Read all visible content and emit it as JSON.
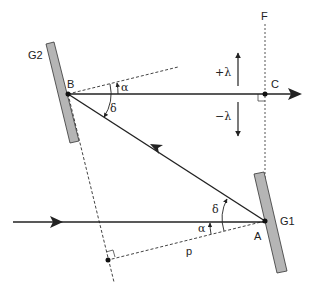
{
  "diagram": {
    "labels": {
      "g2": "G2",
      "g1": "G1",
      "b": "B",
      "c": "C",
      "a": "A",
      "f": "F",
      "p": "p",
      "alpha_top": "α",
      "delta_top": "δ",
      "alpha_bottom": "α",
      "delta_bottom": "δ",
      "plus_lambda": "+λ",
      "minus_lambda": "−λ"
    },
    "colors": {
      "line": "#222222",
      "mirror_fill": "#b5b5b5",
      "mirror_stroke": "#333333",
      "dashed": "#444444"
    }
  }
}
